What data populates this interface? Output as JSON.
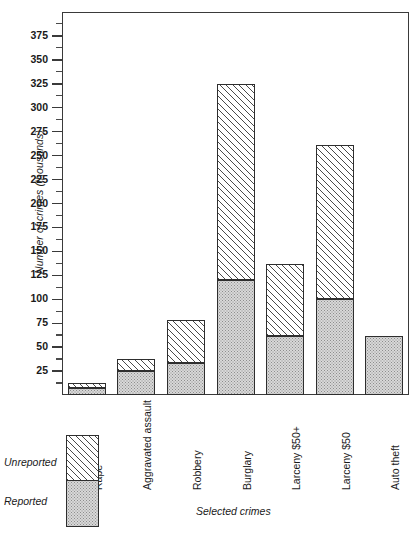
{
  "chart_data": {
    "type": "bar",
    "subtype": "stacked-vertical",
    "title": "",
    "xlabel": "Selected crimes",
    "ylabel": "Number of crimes (thousands)",
    "categories": [
      "Rape",
      "Aggravated assault",
      "Robbery",
      "Burglary",
      "Larceny $50+",
      "Larceny $50",
      "Auto theft"
    ],
    "series": [
      {
        "name": "Reported",
        "values": [
          7,
          25,
          33,
          120,
          62,
          100,
          62
        ]
      },
      {
        "name": "Unreported",
        "values": [
          6,
          13,
          45,
          205,
          75,
          161,
          0
        ]
      }
    ],
    "totals": [
      13,
      38,
      78,
      325,
      137,
      261,
      62
    ],
    "ylim": [
      0,
      400
    ],
    "yticks": [
      25,
      50,
      75,
      100,
      125,
      150,
      175,
      200,
      225,
      250,
      275,
      300,
      325,
      350,
      375
    ],
    "ytick_labels": [
      "25",
      "50",
      "75",
      "100",
      "125",
      "150",
      "175",
      "200",
      "225",
      "250",
      "275",
      "300",
      "325",
      "350",
      "375"
    ],
    "minor_yticks": [
      12.5,
      37.5,
      62.5,
      87.5,
      112.5,
      137.5,
      162.5,
      187.5,
      212.5,
      237.5,
      262.5,
      287.5,
      312.5,
      337.5,
      362.5,
      387.5
    ],
    "grid": false,
    "legend_position": "outside-bottom-left",
    "colors": {
      "reported_fill": "#d8d8d8",
      "reported_pattern": "stipple",
      "unreported_fill": "#ffffff",
      "unreported_pattern": "diagonal-hatch",
      "outline": "#2e2e2e",
      "axis": "#3a3a3a"
    }
  },
  "legend": {
    "unreported_label": "Unreported",
    "reported_label": "Reported"
  }
}
